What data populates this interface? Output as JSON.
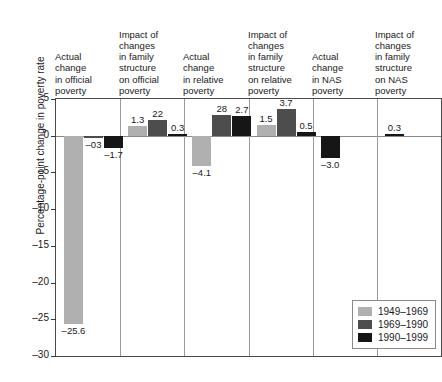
{
  "chart_data": {
    "type": "bar",
    "title": "",
    "subtitle": "",
    "xlabel": "",
    "ylabel": "Percentage-point change in poverty rate",
    "ylim": [
      -30,
      5
    ],
    "yticks": [
      5,
      0,
      -5,
      -10,
      -15,
      -20,
      -25,
      -30
    ],
    "ytick_labels": [
      "5",
      "0",
      "–5",
      "–10",
      "–15",
      "–20",
      "–25",
      "–30"
    ],
    "grid": false,
    "legend_position": "bottom-right",
    "categories": [
      "Actual\nchange\nin official\npoverty",
      "Impact of\nchanges\nin family\nstructure\non official\npoverty",
      "Actual\nchange\nin relative\npoverty",
      "Impact of\nchanges\nin family\nstructure\non relative\npoverty",
      "Actual\nchange\nin NAS\npoverty",
      "Impact of\nchanges\nin family\nstructure\non NAS\npoverty"
    ],
    "series": [
      {
        "name": "1949–1969",
        "color": "#b0b0b0",
        "values": [
          -25.6,
          1.3,
          -4.1,
          1.5,
          null,
          null
        ],
        "labels": [
          "–25.6",
          "1.3",
          "–4.1",
          "1.5",
          null,
          null
        ]
      },
      {
        "name": "1969–1990",
        "color": "#4d4d4d",
        "values": [
          -0.3,
          2.2,
          2.8,
          3.7,
          null,
          null
        ],
        "labels": [
          "–03",
          "22",
          "28",
          "3.7",
          null,
          null
        ]
      },
      {
        "name": "1990–1999",
        "color": "#161616",
        "values": [
          -1.7,
          0.3,
          2.7,
          0.5,
          -3.0,
          0.3
        ],
        "labels": [
          "–1.7",
          "0.3",
          "2.7",
          "0.5",
          "–3.0",
          "0.3"
        ]
      }
    ]
  },
  "legend": {
    "items": [
      {
        "label": "1949–1969",
        "color": "#b0b0b0"
      },
      {
        "label": "1969–1990",
        "color": "#4d4d4d"
      },
      {
        "label": "1990–1999",
        "color": "#161616"
      }
    ]
  }
}
